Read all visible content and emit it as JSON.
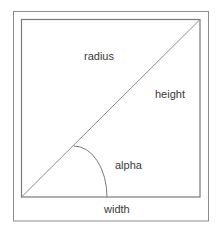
{
  "diagram": {
    "type": "geometry",
    "labels": {
      "radius": "radius",
      "height": "height",
      "alpha": "alpha",
      "width": "width"
    },
    "colors": {
      "line": "#7a7a7a",
      "diagonal": "#8a8a8a",
      "text": "#3a3a3a",
      "background": "#ffffff"
    }
  }
}
